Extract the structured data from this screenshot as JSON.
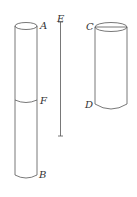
{
  "diagram": {
    "labels": {
      "A": "A",
      "B": "B",
      "C": "C",
      "D": "D",
      "E": "E",
      "F": "F"
    },
    "elements": [
      {
        "id": "cylinder-AB",
        "description": "Tall cylinder with top A, bottom B, division at F"
      },
      {
        "id": "line-E",
        "description": "Vertical line segment labeled E"
      },
      {
        "id": "cylinder-CD",
        "description": "Shorter cylinder with top C, bottom D"
      }
    ],
    "colors": {
      "stroke": "#555555",
      "background": "#ffffff"
    }
  }
}
